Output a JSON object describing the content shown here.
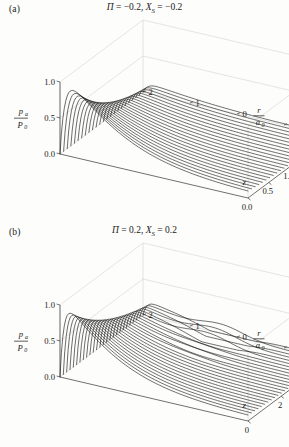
{
  "figure": {
    "background": "#fdfdfb",
    "ink": "#111111",
    "frame_color": "#b9b9b9"
  },
  "panels": [
    {
      "id": "a",
      "label": "(a)",
      "title": {
        "full": "Π = −0.2, X_S = −0.2",
        "pi_symbol": "Π",
        "pi_value": "−0.2",
        "xs_symbol": "X",
        "xs_sub": "S",
        "xs_value": "−0.2",
        "eq": "=",
        "comma": ","
      },
      "axes": {
        "vertical": {
          "num": "p",
          "num_sub": "a",
          "den": "P",
          "den_sub": "0",
          "ticks": [
            "1.0",
            "0.5",
            "0.0"
          ],
          "values": [
            1.0,
            0.5,
            0.0
          ],
          "range": [
            0.0,
            1.0
          ]
        },
        "depth": {
          "label": "z",
          "ticks": [
            "0.0",
            "0.5",
            "1.0",
            "1.5",
            "2.0"
          ],
          "values": [
            0.0,
            0.5,
            1.0,
            1.5,
            2.0
          ],
          "range": [
            0.0,
            2.0
          ]
        },
        "horizontal": {
          "num": "r",
          "den": "a",
          "den_sub": "0",
          "ticks": [
            "2",
            "1",
            "0",
            "−1",
            "−2"
          ],
          "values": [
            2,
            1,
            0,
            -1,
            -2
          ],
          "range": [
            -2,
            2
          ]
        }
      }
    },
    {
      "id": "b",
      "label": "(b)",
      "title": {
        "full": "Π = 0.2, X_S = 0.2",
        "pi_symbol": "Π",
        "pi_value": "0.2",
        "xs_symbol": "X",
        "xs_sub": "S",
        "xs_value": "0.2",
        "eq": "=",
        "comma": ","
      },
      "axes": {
        "vertical": {
          "num": "p",
          "num_sub": "a",
          "den": "P",
          "den_sub": "0",
          "ticks": [
            "1.0",
            "0.5",
            "0.0"
          ],
          "values": [
            1.0,
            0.5,
            0.0
          ],
          "range": [
            0.0,
            1.0
          ]
        },
        "depth": {
          "label": "z",
          "ticks": [
            "0",
            "2",
            "4"
          ],
          "values": [
            0,
            2,
            4
          ],
          "range": [
            0,
            5
          ]
        },
        "horizontal": {
          "num": "r",
          "den": "a",
          "den_sub": "0",
          "ticks": [
            "2",
            "1",
            "0",
            "−1",
            "−2"
          ],
          "values": [
            2,
            1,
            0,
            -1,
            -2
          ],
          "range": [
            -2,
            2
          ]
        }
      }
    }
  ],
  "chart_data": [
    {
      "type": "line",
      "subplot": "a",
      "title": "Π = −0.2, X_S = −0.2",
      "xlabel": "r/a_0",
      "ylabel": "p_a/P_0",
      "zlabel": "z",
      "xlim": [
        -2,
        2
      ],
      "ylim": [
        0.0,
        1.0
      ],
      "zlim": [
        0.0,
        2.0
      ],
      "grid": false,
      "legend": "none",
      "description": "3D wireframe surface: pressure ratio p_a/P_0 versus radial coordinate r/a_0 and axial coordinate z. Profiles rise steeply from 0 near r/a_0 = 2, peak near 1.0 at small z, then decay smoothly toward 0 as z increases.",
      "mesh_curve_count": 24,
      "peak_value": 1.0,
      "peak_location": {
        "r_over_a0": 1.85,
        "z": 0.12
      },
      "series": [
        {
          "name": "z=0.00",
          "peak": 1.0
        },
        {
          "name": "z=0.09",
          "peak": 0.99
        },
        {
          "name": "z=0.17",
          "peak": 0.96
        },
        {
          "name": "z=0.26",
          "peak": 0.92
        },
        {
          "name": "z=0.35",
          "peak": 0.86
        },
        {
          "name": "z=0.43",
          "peak": 0.8
        },
        {
          "name": "z=0.52",
          "peak": 0.73
        },
        {
          "name": "z=0.61",
          "peak": 0.66
        },
        {
          "name": "z=0.70",
          "peak": 0.59
        },
        {
          "name": "z=0.78",
          "peak": 0.53
        },
        {
          "name": "z=0.87",
          "peak": 0.47
        },
        {
          "name": "z=0.96",
          "peak": 0.42
        },
        {
          "name": "z=1.04",
          "peak": 0.37
        },
        {
          "name": "z=1.13",
          "peak": 0.33
        },
        {
          "name": "z=1.22",
          "peak": 0.29
        },
        {
          "name": "z=1.30",
          "peak": 0.26
        },
        {
          "name": "z=1.39",
          "peak": 0.23
        },
        {
          "name": "z=1.48",
          "peak": 0.2
        },
        {
          "name": "z=1.57",
          "peak": 0.18
        },
        {
          "name": "z=1.65",
          "peak": 0.16
        },
        {
          "name": "z=1.74",
          "peak": 0.14
        },
        {
          "name": "z=1.83",
          "peak": 0.12
        },
        {
          "name": "z=1.91",
          "peak": 0.11
        },
        {
          "name": "z=2.00",
          "peak": 0.1
        }
      ]
    },
    {
      "type": "line",
      "subplot": "b",
      "title": "Π = 0.2, X_S = 0.2",
      "xlabel": "r/a_0",
      "ylabel": "p_a/P_0",
      "zlabel": "z",
      "xlim": [
        -2,
        2
      ],
      "ylim": [
        0.0,
        1.0
      ],
      "zlim": [
        0,
        5
      ],
      "grid": false,
      "legend": "none",
      "description": "3D wireframe surface: same quantities as (a) but for positive Π and X_S. Profiles are narrower and show a zigzag oscillatory instability near r/a_0 ≈ 0 at large z.",
      "mesh_curve_count": 26,
      "peak_value": 1.0,
      "peak_location": {
        "r_over_a0": 1.85,
        "z": 0.1
      },
      "oscillation": {
        "present": true,
        "r_over_a0_range": [
          -0.3,
          0.4
        ],
        "amplitude": 0.22
      },
      "series": [
        {
          "name": "z=0.0",
          "peak": 1.0
        },
        {
          "name": "z=0.2",
          "peak": 0.99
        },
        {
          "name": "z=0.4",
          "peak": 0.96
        },
        {
          "name": "z=0.6",
          "peak": 0.92
        },
        {
          "name": "z=0.8",
          "peak": 0.87
        },
        {
          "name": "z=1.0",
          "peak": 0.81
        },
        {
          "name": "z=1.2",
          "peak": 0.75
        },
        {
          "name": "z=1.4",
          "peak": 0.69
        },
        {
          "name": "z=1.6",
          "peak": 0.63
        },
        {
          "name": "z=1.8",
          "peak": 0.58
        },
        {
          "name": "z=2.0",
          "peak": 0.53
        },
        {
          "name": "z=2.2",
          "peak": 0.48
        },
        {
          "name": "z=2.4",
          "peak": 0.44
        },
        {
          "name": "z=2.6",
          "peak": 0.4
        },
        {
          "name": "z=2.8",
          "peak": 0.36
        },
        {
          "name": "z=3.0",
          "peak": 0.33
        },
        {
          "name": "z=3.2",
          "peak": 0.3
        },
        {
          "name": "z=3.4",
          "peak": 0.28
        },
        {
          "name": "z=3.6",
          "peak": 0.25
        },
        {
          "name": "z=3.8",
          "peak": 0.23
        },
        {
          "name": "z=4.0",
          "peak": 0.21
        },
        {
          "name": "z=4.2",
          "peak": 0.2
        },
        {
          "name": "z=4.4",
          "peak": 0.18
        },
        {
          "name": "z=4.6",
          "peak": 0.17
        },
        {
          "name": "z=4.8",
          "peak": 0.16
        },
        {
          "name": "z=5.0",
          "peak": 0.15
        }
      ]
    }
  ]
}
